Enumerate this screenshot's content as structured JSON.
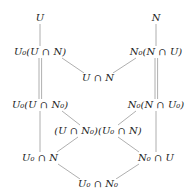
{
  "diagram": {
    "type": "hasse-diagram",
    "title": "",
    "line_color": "#9a9a9a",
    "text_color": "#222222",
    "nodes": [
      {
        "id": "U",
        "label": "U",
        "x": 40,
        "y": 18
      },
      {
        "id": "N",
        "label": "N",
        "x": 156,
        "y": 18
      },
      {
        "id": "U0_UcapN",
        "label": "U₀(U ∩ N)",
        "x": 40,
        "y": 52
      },
      {
        "id": "N0_NcapU",
        "label": "N₀(N ∩ U)",
        "x": 156,
        "y": 52
      },
      {
        "id": "UcapN",
        "label": "U ∩ N",
        "x": 98,
        "y": 78
      },
      {
        "id": "U0_UcapN0",
        "label": "U₀(U ∩ N₀)",
        "x": 40,
        "y": 105
      },
      {
        "id": "N0_NcapU0",
        "label": "N₀(N ∩ U₀)",
        "x": 156,
        "y": 105
      },
      {
        "id": "middle",
        "label": "(U ∩ N₀)(U₀ ∩ N)",
        "x": 98,
        "y": 131
      },
      {
        "id": "U0capN",
        "label": "U₀ ∩ N",
        "x": 40,
        "y": 158
      },
      {
        "id": "N0capU",
        "label": "N₀ ∩ U",
        "x": 156,
        "y": 158
      },
      {
        "id": "U0capN0",
        "label": "U₀ ∩ N₀",
        "x": 98,
        "y": 184
      }
    ],
    "edges": [
      {
        "from": "U",
        "to": "U0_UcapN",
        "style": "single"
      },
      {
        "from": "N",
        "to": "N0_NcapU",
        "style": "single"
      },
      {
        "from": "U0_UcapN",
        "to": "UcapN",
        "style": "single"
      },
      {
        "from": "N0_NcapU",
        "to": "UcapN",
        "style": "single"
      },
      {
        "from": "U0_UcapN",
        "to": "U0_UcapN0",
        "style": "double"
      },
      {
        "from": "N0_NcapU",
        "to": "N0_NcapU0",
        "style": "double"
      },
      {
        "from": "U0_UcapN0",
        "to": "middle",
        "style": "single"
      },
      {
        "from": "N0_NcapU0",
        "to": "middle",
        "style": "single"
      },
      {
        "from": "U0_UcapN0",
        "to": "U0capN",
        "style": "single"
      },
      {
        "from": "N0_NcapU0",
        "to": "N0capU",
        "style": "single"
      },
      {
        "from": "middle",
        "to": "U0capN",
        "style": "single"
      },
      {
        "from": "middle",
        "to": "N0capU",
        "style": "single"
      },
      {
        "from": "U0capN",
        "to": "U0capN0",
        "style": "single"
      },
      {
        "from": "N0capU",
        "to": "U0capN0",
        "style": "single"
      }
    ]
  }
}
